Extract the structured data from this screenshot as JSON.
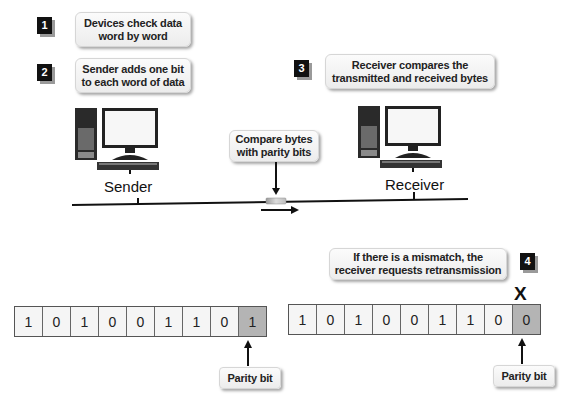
{
  "steps": [
    {
      "number": "1",
      "text": "Devices check data word by word"
    },
    {
      "number": "2",
      "text": "Sender adds one bit to each word of data"
    },
    {
      "number": "3",
      "text": "Receiver compares the transmitted and received bytes"
    },
    {
      "number": "4",
      "text": "If there is a mismatch, the receiver requests retransmission"
    }
  ],
  "steps_lines": {
    "s1": [
      "Devices check data",
      "word by word"
    ],
    "s2": [
      "Sender adds one bit",
      "to each word of data"
    ],
    "s3": [
      "Receiver compares the",
      "transmitted and received bytes"
    ],
    "s4": [
      "If there is a mismatch, the",
      "receiver requests retransmission"
    ]
  },
  "network": {
    "sender_label": "Sender",
    "receiver_label": "Receiver",
    "compare_label": [
      "Compare bytes",
      "with parity bits"
    ]
  },
  "sent_word": {
    "bits": [
      "1",
      "0",
      "1",
      "0",
      "0",
      "1",
      "1",
      "0"
    ],
    "parity": "1",
    "parity_label": "Parity bit"
  },
  "received_word": {
    "bits": [
      "1",
      "0",
      "1",
      "0",
      "0",
      "1",
      "1",
      "0"
    ],
    "parity": "0",
    "parity_label": "Parity bit",
    "mismatch_mark": "X"
  },
  "colors": {
    "badge": "#111111",
    "parity_cell": "#b4b4b4",
    "cell": "#f5f5f5"
  }
}
